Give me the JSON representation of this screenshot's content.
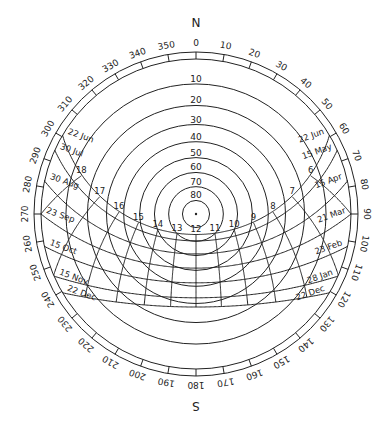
{
  "diagram": {
    "type": "stereographic sun path",
    "latitude_deg": 38.5,
    "colors": {
      "line": "#222222",
      "background": "#ffffff"
    },
    "cardinals": {
      "north": "N",
      "south": "S"
    },
    "azimuth_ticks": [
      0,
      10,
      20,
      30,
      40,
      50,
      60,
      70,
      80,
      90,
      100,
      110,
      120,
      130,
      140,
      150,
      160,
      170,
      180,
      190,
      200,
      210,
      220,
      230,
      240,
      250,
      260,
      270,
      280,
      290,
      300,
      310,
      320,
      330,
      340,
      350
    ],
    "altitude_circles": [
      10,
      20,
      30,
      40,
      50,
      60,
      70,
      80
    ],
    "hours": [
      6,
      7,
      8,
      9,
      10,
      11,
      12,
      13,
      14,
      15,
      16,
      17,
      18
    ],
    "hour_labels": [
      "6",
      "7",
      "8",
      "9",
      "10",
      "11",
      "12",
      "13",
      "14",
      "15",
      "16",
      "17",
      "18"
    ],
    "date_lines": [
      {
        "declination": 23.44,
        "east_label": "22 Jun",
        "west_label": "22 Jun"
      },
      {
        "declination": 18.8,
        "east_label": "15 May",
        "west_label": "30 Jul"
      },
      {
        "declination": 9.6,
        "east_label": "15 Apr",
        "west_label": "30 Aug"
      },
      {
        "declination": 0.0,
        "east_label": "21 Mar",
        "west_label": "23 Sep"
      },
      {
        "declination": -9.4,
        "east_label": "23 Feb",
        "west_label": "15 Oct"
      },
      {
        "declination": -18.3,
        "east_label": "28 Jan",
        "west_label": "15 Nov"
      },
      {
        "declination": -23.44,
        "east_label": "22 Dec",
        "west_label": "22 Dec"
      }
    ]
  }
}
